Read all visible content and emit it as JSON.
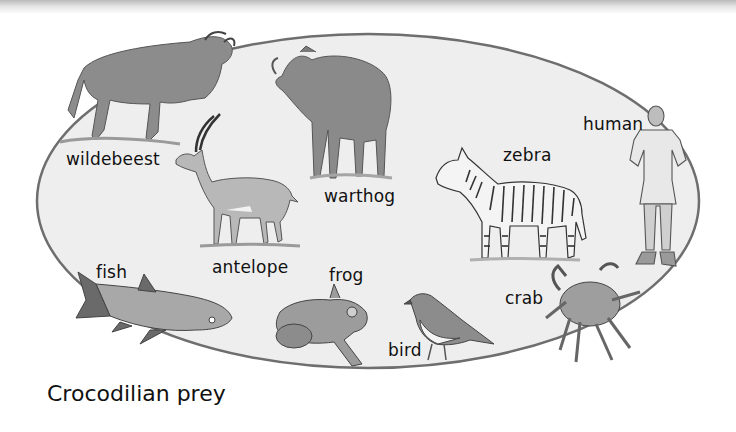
{
  "diagram": {
    "title": "Crocodilian prey",
    "colors": {
      "background": "#ffffff",
      "ellipse_fill": "#eeeeee",
      "ellipse_stroke": "#6e6e6e",
      "text": "#111111",
      "illustration": "#8a8a8a"
    },
    "boundary": {
      "shape": "ellipse",
      "cx": 368,
      "cy": 201,
      "rx": 331,
      "ry": 167
    },
    "animals": [
      {
        "id": "wildebeest",
        "label": "wildebeest",
        "icon": "wildebeest-illustration",
        "label_pos": [
          66,
          150
        ]
      },
      {
        "id": "warthog",
        "label": "warthog",
        "icon": "warthog-illustration",
        "label_pos": [
          324,
          187
        ]
      },
      {
        "id": "zebra",
        "label": "zebra",
        "icon": "zebra-illustration",
        "label_pos": [
          503,
          146
        ]
      },
      {
        "id": "human",
        "label": "human",
        "icon": "human-illustration",
        "label_pos": [
          583,
          115
        ]
      },
      {
        "id": "antelope",
        "label": "antelope",
        "icon": "antelope-illustration",
        "label_pos": [
          212,
          258
        ]
      },
      {
        "id": "fish",
        "label": "fish",
        "icon": "fish-illustration",
        "label_pos": [
          96,
          262
        ]
      },
      {
        "id": "frog",
        "label": "frog",
        "icon": "frog-illustration",
        "label_pos": [
          329,
          266
        ]
      },
      {
        "id": "bird",
        "label": "bird",
        "icon": "bird-illustration",
        "label_pos": [
          388,
          341
        ]
      },
      {
        "id": "crab",
        "label": "crab",
        "icon": "crab-illustration",
        "label_pos": [
          505,
          289
        ]
      }
    ]
  }
}
